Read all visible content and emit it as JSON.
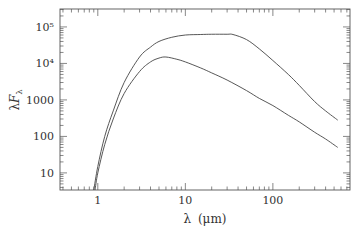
{
  "chart_data": {
    "type": "line",
    "title": "",
    "xlabel": "λ (μm)",
    "ylabel": "λF_λ",
    "xscale": "log",
    "yscale": "log",
    "xlim": [
      0.37,
      760
    ],
    "ylim": [
      3.4,
      310000
    ],
    "grid": false,
    "legend": null,
    "x_ticks": [
      {
        "value": 1,
        "label": "1"
      },
      {
        "value": 10,
        "label": "10"
      },
      {
        "value": 100,
        "label": "100"
      }
    ],
    "y_ticks": [
      {
        "value": 10,
        "label": "10"
      },
      {
        "value": 100,
        "label": "100"
      },
      {
        "value": 1000,
        "label": "1000"
      },
      {
        "value": 10000,
        "label": "10⁴"
      },
      {
        "value": 100000,
        "label": "10⁵"
      }
    ],
    "series": [
      {
        "name": "upper",
        "x": [
          0.9,
          1.0,
          1.2,
          1.5,
          2,
          3,
          4,
          5,
          7,
          10,
          15,
          20,
          30,
          35,
          50,
          70,
          100,
          150,
          200,
          300,
          400,
          550
        ],
        "y": [
          3.4,
          15,
          100,
          500,
          3000,
          15000,
          28000,
          40000,
          52000,
          60000,
          62000,
          63000,
          63000,
          62000,
          45000,
          25000,
          12000,
          5000,
          2500,
          900,
          500,
          280
        ]
      },
      {
        "name": "lower",
        "x": [
          0.93,
          1.0,
          1.2,
          1.5,
          2,
          3,
          4,
          5,
          6,
          8,
          10,
          15,
          20,
          30,
          50,
          70,
          100,
          150,
          200,
          300,
          400,
          550
        ],
        "y": [
          3.4,
          10,
          60,
          300,
          1500,
          6000,
          11000,
          14000,
          15000,
          13000,
          11000,
          7500,
          5500,
          3500,
          1800,
          1100,
          700,
          380,
          250,
          130,
          85,
          50
        ]
      }
    ]
  },
  "axes": {
    "xlabel_main": "λ",
    "xlabel_unit": "(μm)",
    "ylabel_lambda": "λ",
    "ylabel_F": "F",
    "ylabel_sub": "λ"
  }
}
